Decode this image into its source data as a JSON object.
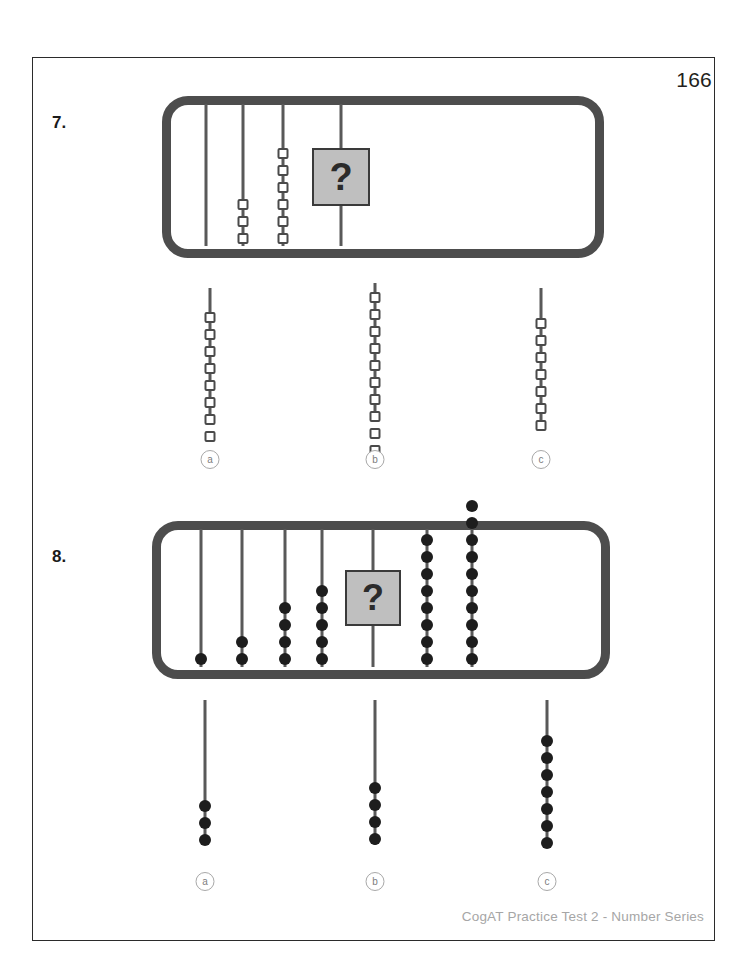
{
  "page": {
    "number": "166",
    "footer": "CogAT Practice Test 2 - Number Series",
    "width": 746,
    "height": 968
  },
  "colors": {
    "frame": "#4d4d4d",
    "rod": "#595959",
    "bead_open_border": "#4a4a4a",
    "bead_filled": "#1d1d1d",
    "qbox_fill": "#bfbfbf",
    "qbox_border": "#3a3a3a",
    "option_circle": "#a8a8a8",
    "footer_text": "#a6a6a6",
    "page_border": "#2b2b2b"
  },
  "questions": [
    {
      "label": "7.",
      "label_pos": {
        "x": 52,
        "y": 113
      },
      "frame": {
        "x": 162,
        "y": 96,
        "w": 442,
        "h": 162
      },
      "bead_style": "square",
      "bead_spacing": 17,
      "bead_size": 11,
      "rod_top": 8,
      "rod_bottom": 150,
      "rods": [
        {
          "x": 206,
          "beads": 0
        },
        {
          "x": 243,
          "beads": 3
        },
        {
          "x": 283,
          "beads": 6
        },
        {
          "x": 341,
          "beads": 0
        }
      ],
      "question_box": {
        "rod_x": 341,
        "y": 148,
        "w": 58,
        "h": 58,
        "glyph": "?",
        "font_size": 38
      },
      "options": [
        {
          "letter": "a",
          "x": 210,
          "beads": 8,
          "rod_top": 288,
          "rod_bottom": 418,
          "bead_start": 312,
          "circle_y": 450
        },
        {
          "letter": "b",
          "x": 375,
          "beads": 10,
          "rod_top": 283,
          "rod_bottom": 420,
          "bead_start": 292,
          "circle_y": 450
        },
        {
          "letter": "c",
          "x": 541,
          "beads": 7,
          "rod_top": 288,
          "rod_bottom": 420,
          "bead_start": 318,
          "circle_y": 450
        }
      ]
    },
    {
      "label": "8.",
      "label_pos": {
        "x": 52,
        "y": 547
      },
      "frame": {
        "x": 152,
        "y": 521,
        "w": 458,
        "h": 158
      },
      "bead_style": "round",
      "bead_spacing": 17,
      "bead_size": 12,
      "rod_top": 8,
      "rod_bottom": 146,
      "rods": [
        {
          "x": 201,
          "beads": 1
        },
        {
          "x": 242,
          "beads": 2
        },
        {
          "x": 285,
          "beads": 4
        },
        {
          "x": 322,
          "beads": 5
        },
        {
          "x": 373,
          "beads": 0
        },
        {
          "x": 427,
          "beads": 8
        },
        {
          "x": 472,
          "beads": 10
        }
      ],
      "question_box": {
        "rod_x": 373,
        "y": 570,
        "w": 56,
        "h": 56,
        "glyph": "?",
        "font_size": 36
      },
      "options": [
        {
          "letter": "a",
          "x": 205,
          "beads": 3,
          "rod_top": 700,
          "rod_bottom": 845,
          "bead_start": 800,
          "circle_y": 872
        },
        {
          "letter": "b",
          "x": 375,
          "beads": 4,
          "rod_top": 700,
          "rod_bottom": 845,
          "bead_start": 782,
          "circle_y": 872
        },
        {
          "letter": "c",
          "x": 547,
          "beads": 7,
          "rod_top": 700,
          "rod_bottom": 845,
          "bead_start": 735,
          "circle_y": 872
        }
      ]
    }
  ]
}
